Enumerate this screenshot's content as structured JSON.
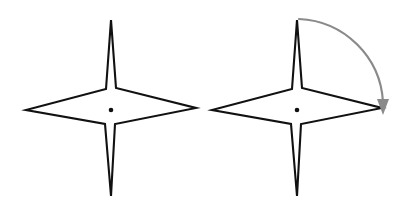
{
  "figure": {
    "type": "diagram",
    "background_color": "#ffffff",
    "width": 409,
    "height": 211
  },
  "style": {
    "star_stroke_color": "#111111",
    "star_fill_color": "#ffffff",
    "star_stroke_width": 2.1,
    "arc_color": "#8a8a8a",
    "arc_stroke_width": 2.2,
    "center_dot_color": "#111111",
    "center_dot_radius": 2.3
  },
  "shapes": {
    "left_star": {
      "name": "four-pointed-star",
      "label": "",
      "center": {
        "x": 111,
        "y": 110
      },
      "tips": {
        "top": {
          "x": 111,
          "y": 20
        },
        "right": {
          "x": 196,
          "y": 108
        },
        "bottom": {
          "x": 111,
          "y": 196
        },
        "left": {
          "x": 26,
          "y": 110
        }
      },
      "points": "111,20 116,88 196,108 115,124 111,196 105,124 26,110 106,89",
      "has_center_dot": true,
      "has_rotation_arrow": false
    },
    "right_star": {
      "name": "four-pointed-star",
      "label": "",
      "center": {
        "x": 297,
        "y": 110
      },
      "tips": {
        "top": {
          "x": 297,
          "y": 20
        },
        "right": {
          "x": 382,
          "y": 108
        },
        "bottom": {
          "x": 297,
          "y": 196
        },
        "left": {
          "x": 212,
          "y": 110
        }
      },
      "points": "297,20 302,88 382,108 301,124 297,196 291,124 212,110 292,89",
      "has_center_dot": true,
      "has_rotation_arrow": true
    }
  },
  "annotations": {
    "rotation_arrow": {
      "name": "clockwise-rotation-arrow",
      "direction": "clockwise",
      "angle_degrees": 90,
      "color": "#8a8a8a",
      "start": {
        "x": 299,
        "y": 19
      },
      "end": {
        "x": 383,
        "y": 105
      },
      "arc_path": "M 299 19 A 88 88 0 0 1 383 102",
      "arrowhead_points": "383,115 377,99 389,99",
      "label": ""
    }
  }
}
